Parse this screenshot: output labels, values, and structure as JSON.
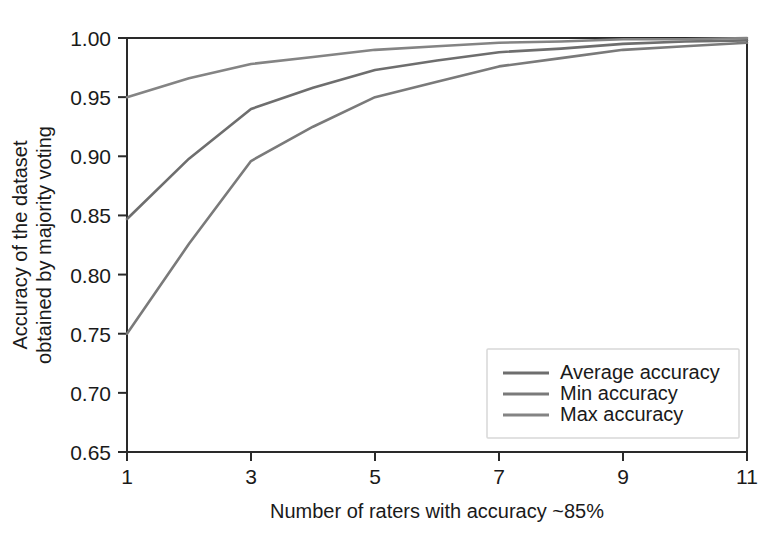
{
  "chart_data": {
    "type": "line",
    "title": "",
    "xlabel": "Number of raters with accuracy ~85%",
    "ylabel": "Accuracy of the dataset\nobtained by majority voting",
    "ylabel_line1": "Accuracy of the dataset",
    "ylabel_line2": "obtained by majority voting",
    "x": [
      1,
      2,
      3,
      4,
      5,
      6,
      7,
      8,
      9,
      10,
      11
    ],
    "xlim": [
      1,
      11
    ],
    "ylim": [
      0.65,
      1.0
    ],
    "xticks": [
      1,
      3,
      5,
      7,
      9,
      11
    ],
    "xtick_labels": [
      "1",
      "3",
      "5",
      "7",
      "9",
      "11"
    ],
    "yticks": [
      0.65,
      0.7,
      0.75,
      0.8,
      0.85,
      0.9,
      0.95,
      1.0
    ],
    "ytick_labels": [
      "0.65",
      "0.70",
      "0.75",
      "0.80",
      "0.85",
      "0.90",
      "0.95",
      "1.00"
    ],
    "grid": false,
    "legend_position": "lower right",
    "series": [
      {
        "name": "Average accuracy",
        "color": "#6e6e6e",
        "values": [
          0.847,
          0.898,
          0.94,
          0.958,
          0.973,
          0.981,
          0.988,
          0.991,
          0.995,
          0.997,
          0.998
        ]
      },
      {
        "name": "Min accuracy",
        "color": "#7a7a7a",
        "values": [
          0.75,
          0.826,
          0.896,
          0.925,
          0.95,
          0.963,
          0.976,
          0.983,
          0.99,
          0.993,
          0.996
        ]
      },
      {
        "name": "Max accuracy",
        "color": "#848484",
        "values": [
          0.95,
          0.966,
          0.978,
          0.984,
          0.99,
          0.993,
          0.996,
          0.997,
          0.999,
          0.999,
          1.0
        ]
      }
    ]
  },
  "legend": {
    "items": [
      {
        "label": "Average accuracy"
      },
      {
        "label": "Min accuracy"
      },
      {
        "label": "Max accuracy"
      }
    ]
  },
  "colors": {
    "axis": "#2a2a2a",
    "background": "#ffffff",
    "legend_border": "#d8d8d8"
  }
}
